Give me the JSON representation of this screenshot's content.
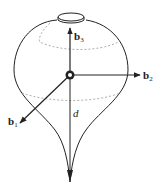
{
  "figure": {
    "colors": {
      "stroke": "#222222",
      "dashed": "#999999",
      "background": "#ffffff"
    },
    "labels": {
      "b3": {
        "base": "b",
        "sub": "3"
      },
      "b2": {
        "base": "b",
        "sub": "2"
      },
      "b1": {
        "base": "b",
        "sub": "1"
      },
      "d": "d"
    }
  }
}
